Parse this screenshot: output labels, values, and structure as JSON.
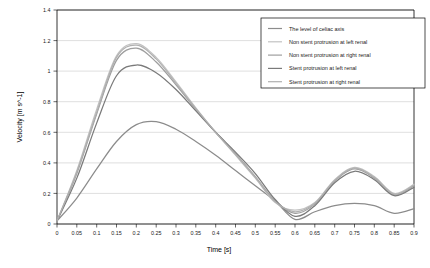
{
  "chart_data": {
    "type": "line",
    "title": "",
    "xlabel": "Time [s]",
    "ylabel": "Velocity [m s^-1]",
    "xlim": [
      0,
      0.9
    ],
    "ylim": [
      0,
      1.4
    ],
    "grid": true,
    "legend_position": "top-right inside plot",
    "xticks": [
      "0",
      "0.05",
      "0.1",
      "0.15",
      "0.2",
      "0.25",
      "0.3",
      "0.35",
      "0.4",
      "0.45",
      "0.5",
      "0.55",
      "0.6",
      "0.65",
      "0.7",
      "0.75",
      "0.8",
      "0.85",
      "0.9"
    ],
    "yticks": [
      "0",
      "0.2",
      "0.4",
      "0.6",
      "0.8",
      "1",
      "1.2",
      "1.4"
    ],
    "x": [
      0,
      0.05,
      0.1,
      0.15,
      0.2,
      0.25,
      0.3,
      0.35,
      0.4,
      0.45,
      0.5,
      0.55,
      0.6,
      0.65,
      0.7,
      0.75,
      0.8,
      0.85,
      0.9
    ],
    "series": [
      {
        "name": "The level of celiac axis",
        "color": "#8c8c8c",
        "values": [
          0.02,
          0.17,
          0.36,
          0.54,
          0.65,
          0.67,
          0.62,
          0.54,
          0.45,
          0.35,
          0.25,
          0.15,
          0.03,
          0.08,
          0.12,
          0.135,
          0.12,
          0.07,
          0.1
        ]
      },
      {
        "name": "Non stent protrusion at left renal",
        "color": "#c2c2c2",
        "values": [
          0.02,
          0.35,
          0.75,
          1.1,
          1.18,
          1.09,
          0.93,
          0.76,
          0.6,
          0.45,
          0.3,
          0.14,
          0.09,
          0.14,
          0.29,
          0.37,
          0.31,
          0.2,
          0.26
        ]
      },
      {
        "name": "Non stent protrusion at right renal",
        "color": "#9e9e9e",
        "values": [
          0.02,
          0.33,
          0.72,
          1.07,
          1.15,
          1.06,
          0.91,
          0.75,
          0.6,
          0.46,
          0.31,
          0.15,
          0.07,
          0.13,
          0.28,
          0.36,
          0.3,
          0.19,
          0.25
        ]
      },
      {
        "name": "Stent protrusion at left renal",
        "color": "#7a7a7a",
        "values": [
          0.02,
          0.3,
          0.66,
          0.97,
          1.04,
          0.99,
          0.88,
          0.74,
          0.6,
          0.47,
          0.33,
          0.16,
          0.05,
          0.12,
          0.27,
          0.345,
          0.29,
          0.185,
          0.24
        ]
      },
      {
        "name": "Stent protrusion at right renal",
        "color": "#b0b0b0",
        "values": [
          0.02,
          0.34,
          0.73,
          1.09,
          1.17,
          1.08,
          0.92,
          0.755,
          0.6,
          0.455,
          0.305,
          0.145,
          0.08,
          0.135,
          0.285,
          0.365,
          0.305,
          0.195,
          0.255
        ]
      }
    ],
    "peaks": {
      "celiac_axis_peak": 0.67,
      "celiac_axis_peak_time": 0.22,
      "max_peak": 1.19,
      "max_peak_time": 0.18,
      "secondary_hump_peak": 0.37,
      "secondary_hump_time": 0.73,
      "trough_value": 0.03,
      "trough_time": 0.58
    }
  }
}
